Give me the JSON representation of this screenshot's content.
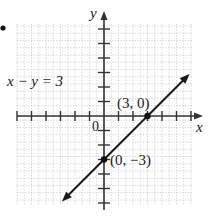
{
  "graph": {
    "equation_label": "x − y = 3",
    "x_axis_label": "x",
    "y_axis_label": "y",
    "origin_label": "0",
    "points": [
      {
        "label": "(3, 0)",
        "x": 3,
        "y": 0
      },
      {
        "label": "(0, −3)",
        "x": 0,
        "y": -3
      }
    ],
    "line": {
      "equation": "y = x - 3",
      "from": {
        "x": -2.9,
        "y": -5.9
      },
      "to": {
        "x": 5.9,
        "y": 2.9
      }
    },
    "grid": {
      "x_range": [
        -6,
        6
      ],
      "y_range": [
        -6,
        6
      ],
      "step": 1
    },
    "colors": {
      "axis": "#333333",
      "grid": "#c8c8c8",
      "line": "#1a1a1a"
    }
  }
}
